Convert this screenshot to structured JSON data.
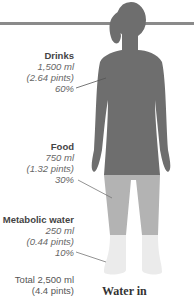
{
  "diagram": {
    "caption": "Water in",
    "colors": {
      "drinks": "#6e6e6e",
      "food": "#b3b3b3",
      "metabolic": "#ebebeb",
      "line": "#8a8a8a"
    },
    "segments": [
      {
        "name": "Drinks",
        "amount": "1,500 ml",
        "pints": "(2.64 pints)",
        "percent": "60%"
      },
      {
        "name": "Food",
        "amount": "750 ml",
        "pints": "(1.32 pints)",
        "percent": "30%"
      },
      {
        "name": "Metabolic water",
        "amount": "250 ml",
        "pints": "(0.44 pints)",
        "percent": "10%"
      }
    ],
    "total": {
      "line1": "Total 2,500 ml",
      "line2": "(4.4 pints)"
    }
  }
}
